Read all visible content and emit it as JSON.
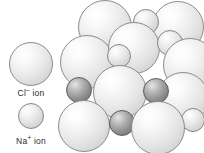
{
  "figure": {
    "background_color": "#ffffff",
    "width": 204,
    "height": 153
  },
  "legend": {
    "entries": [
      {
        "key": "chloride",
        "ion_symbol": "Cl",
        "charge": "–",
        "label_text": "Cl",
        "label_suffix": " ion",
        "label_full": "Cl– ion",
        "species": "Cl- ion",
        "color": "#e8e8e8",
        "outline_color": "#8d8d8d",
        "radius_px": 22
      },
      {
        "key": "sodium",
        "ion_symbol": "Na",
        "charge": "+",
        "label_text": "Na",
        "label_suffix": " ion",
        "label_full": "Na+ ion",
        "species": "Na+ ion",
        "color": "#d6d6d6",
        "outline_color": "#868686",
        "radius_px": 13
      }
    ]
  },
  "lattice": {
    "description": "Face-centred cubic rock-salt packing of alternating large Cl- and small Na+ spheres",
    "spheres": [
      {
        "id": "cl-1",
        "type": "cl",
        "cx": 43,
        "cy": 27,
        "r": 27,
        "z": 3
      },
      {
        "id": "cl-2",
        "type": "cl",
        "cx": 116,
        "cy": 27,
        "r": 26,
        "z": 3
      },
      {
        "id": "na-a",
        "type": "na-light",
        "cx": 84,
        "cy": 22,
        "r": 13,
        "z": 4
      },
      {
        "id": "cl-3",
        "type": "cl",
        "cx": 25,
        "cy": 62,
        "r": 27,
        "z": 6
      },
      {
        "id": "cl-4",
        "type": "cl",
        "cx": 72,
        "cy": 48,
        "r": 26,
        "z": 7
      },
      {
        "id": "na-b",
        "type": "na-light",
        "cx": 108,
        "cy": 43,
        "r": 13,
        "z": 8
      },
      {
        "id": "cl-5",
        "type": "cl",
        "cx": 128,
        "cy": 65,
        "r": 27,
        "z": 9
      },
      {
        "id": "na-c",
        "type": "na-light",
        "cx": 57,
        "cy": 56,
        "r": 12,
        "z": 10
      },
      {
        "id": "na-d",
        "type": "na",
        "cx": 135,
        "cy": 69,
        "r": 11,
        "z": 5
      },
      {
        "id": "na-e",
        "type": "na",
        "cx": 17,
        "cy": 90,
        "r": 13,
        "z": 12
      },
      {
        "id": "cl-6",
        "type": "cl",
        "cx": 58,
        "cy": 92,
        "r": 27,
        "z": 13
      },
      {
        "id": "na-f",
        "type": "na",
        "cx": 94,
        "cy": 91,
        "r": 13,
        "z": 14
      },
      {
        "id": "cl-7",
        "type": "cl",
        "cx": 121,
        "cy": 98,
        "r": 26,
        "z": 11
      },
      {
        "id": "cl-8",
        "type": "cl",
        "cx": 22,
        "cy": 126,
        "r": 26,
        "z": 16
      },
      {
        "id": "na-g",
        "type": "na",
        "cx": 60,
        "cy": 123,
        "r": 13,
        "z": 17
      },
      {
        "id": "cl-9",
        "type": "cl",
        "cx": 96,
        "cy": 128,
        "r": 27,
        "z": 18
      },
      {
        "id": "na-h",
        "type": "na-light",
        "cx": 131,
        "cy": 120,
        "r": 12,
        "z": 15
      }
    ]
  }
}
